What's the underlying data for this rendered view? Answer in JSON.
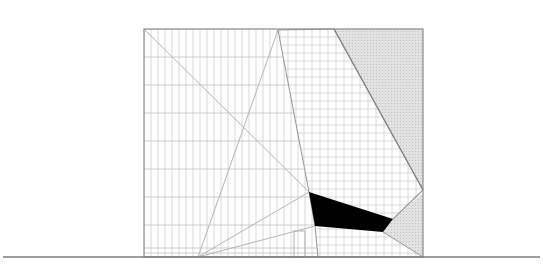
{
  "figure": {
    "type": "architectural-elevation",
    "width": 543,
    "height": 280,
    "colors": {
      "background": "#ffffff",
      "outline": "#8a8a8a",
      "grid": "#cfcfcf",
      "grid_major": "#c2c2c2",
      "construction_line": "#b5b5b5",
      "shade_fill": "#dedede",
      "solid_fill": "#000000",
      "ground_line": "#7d7d7d"
    },
    "ground_line": {
      "x1": 3,
      "x2": 540,
      "y": 257
    },
    "frame": {
      "x": 144,
      "y": 29,
      "w": 279,
      "h": 228
    },
    "grids": {
      "left": {
        "vx_step": 7,
        "hy_step": 28
      },
      "right": {
        "vx_step": 8,
        "hy_step": 8
      }
    },
    "points": {
      "apex": [
        278,
        30
      ],
      "top_left": [
        144,
        29
      ],
      "fan_origin": [
        198,
        257
      ],
      "shade_top_left": [
        334,
        29
      ],
      "shade_right_meet": [
        423,
        190
      ],
      "black_a": [
        309,
        192
      ],
      "black_b": [
        393,
        219
      ],
      "black_c": [
        383,
        232
      ],
      "black_d": [
        315,
        226
      ],
      "steep_foot": [
        318,
        257
      ],
      "lower_shade_top": [
        423,
        193
      ]
    },
    "door": {
      "x": 294,
      "y": 231,
      "w": 11,
      "h": 26
    }
  }
}
